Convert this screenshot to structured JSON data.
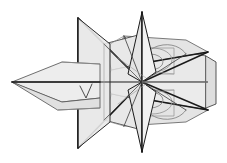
{
  "figure": {
    "title": "Faceted polyhedral wireframe illustration",
    "type": "line-art-vector-illustration",
    "canvas": {
      "width": 227,
      "height": 163,
      "background": "#ffffff"
    },
    "palette": {
      "background": "#ffffff",
      "fill_light": "#ededed",
      "fill_mid": "#e2e2e2",
      "fill_pale": "#f4f4f4",
      "fill_shade": "#d6d6d6",
      "stroke_dark": "#1a1a1a",
      "stroke_mid": "#555555",
      "stroke_light": "#9a9a9a",
      "stroke_hair": "#b8b8b8"
    },
    "geometry": {
      "center_axis_y": 81,
      "axis_start_x": 12,
      "axis_end_x": 208,
      "nose_tip": [
        12,
        82
      ],
      "top_spike_apex": [
        142,
        12
      ],
      "bottom_spike_apex": [
        142,
        152
      ],
      "left_plane_top": [
        78,
        18
      ],
      "left_plane_bottom": [
        78,
        148
      ],
      "right_body_x": 208,
      "right_body_top": [
        206,
        55
      ],
      "right_body_bottom": [
        206,
        110
      ]
    },
    "elements": [
      {
        "id": "nose-cone",
        "label": "Left pointed nose cone",
        "shape": "kite"
      },
      {
        "id": "left-vertical-plane",
        "label": "Left vertical planar wing",
        "shape": "quad"
      },
      {
        "id": "bowtie-wing",
        "label": "Crossing bowtie wing planes",
        "shape": "bowtie"
      },
      {
        "id": "top-spike",
        "label": "Upper vertical spike",
        "shape": "triangle"
      },
      {
        "id": "bottom-spike",
        "label": "Lower vertical spike",
        "shape": "triangle"
      },
      {
        "id": "right-body",
        "label": "Right faceted body block",
        "shape": "hexagonal-prism"
      },
      {
        "id": "arc-detail-upper",
        "label": "Upper elliptical arc detail",
        "shape": "ellipse-arc"
      },
      {
        "id": "arc-detail-lower",
        "label": "Lower elliptical arc detail",
        "shape": "ellipse-arc"
      },
      {
        "id": "center-axis",
        "label": "Horizontal center axis line",
        "shape": "line"
      }
    ]
  }
}
